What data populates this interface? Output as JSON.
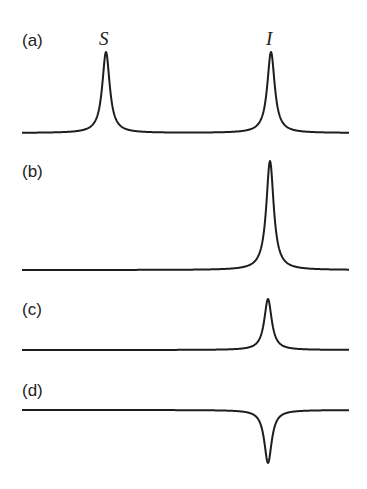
{
  "figure": {
    "panels": [
      {
        "label": "(a)",
        "peaks": [
          {
            "name": "S",
            "x": 106,
            "sign": 1,
            "height": 81
          },
          {
            "name": "I",
            "x": 271,
            "sign": 1,
            "height": 81
          }
        ],
        "baseline_y": 133,
        "label_y": 46
      },
      {
        "label": "(b)",
        "peaks": [
          {
            "x": 270,
            "sign": 1,
            "height": 109
          }
        ],
        "baseline_y": 270,
        "label_y": 177
      },
      {
        "label": "(c)",
        "peaks": [
          {
            "x": 268,
            "sign": 1,
            "height": 51
          }
        ],
        "baseline_y": 350,
        "label_y": 315
      },
      {
        "label": "(d)",
        "peaks": [
          {
            "x": 268,
            "sign": -1,
            "height": 53
          }
        ],
        "baseline_y": 410,
        "label_y": 396
      }
    ],
    "peak_labels": {
      "S": "S",
      "I": "I"
    },
    "colors": {
      "line": "#1e1e1e",
      "text": "#222222",
      "background": "#ffffff"
    }
  },
  "chart_data": {
    "type": "line",
    "title": "",
    "xlabel": "",
    "ylabel": "",
    "series": [
      {
        "name": "(a)",
        "peaks": [
          {
            "label": "S",
            "relative_intensity": 1.0
          },
          {
            "label": "I",
            "relative_intensity": 1.0
          }
        ]
      },
      {
        "name": "(b)",
        "peaks": [
          {
            "label": "I",
            "relative_intensity": 1.35
          }
        ]
      },
      {
        "name": "(c)",
        "peaks": [
          {
            "label": "I",
            "relative_intensity": 0.63
          }
        ]
      },
      {
        "name": "(d)",
        "peaks": [
          {
            "label": "I",
            "relative_intensity": -0.65
          }
        ]
      }
    ],
    "annotations": [
      "S",
      "I"
    ],
    "grid": false
  }
}
